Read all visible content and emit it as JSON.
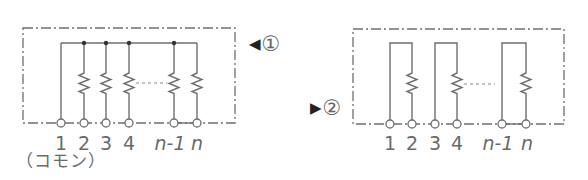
{
  "colors": {
    "line": "#6f6f6f",
    "text": "#6a6a6a",
    "marker": "#222222",
    "background": "#ffffff"
  },
  "left_diagram": {
    "type": "common-bus resistor network",
    "marker": {
      "arrow": "◀",
      "number": "①"
    },
    "terminals": [
      {
        "pin": "1",
        "italic": false
      },
      {
        "pin": "2",
        "italic": false
      },
      {
        "pin": "3",
        "italic": false
      },
      {
        "pin": "4",
        "italic": false
      },
      {
        "pin": "n-1",
        "italic": true
      },
      {
        "pin": "n",
        "italic": true
      }
    ],
    "common_note": "（コモン）"
  },
  "right_diagram": {
    "type": "isolated resistor network",
    "marker": {
      "arrow": "▶",
      "number": "②"
    },
    "terminals": [
      {
        "pin": "1",
        "italic": false
      },
      {
        "pin": "2",
        "italic": false
      },
      {
        "pin": "3",
        "italic": false
      },
      {
        "pin": "4",
        "italic": false
      },
      {
        "pin": "n-1",
        "italic": true
      },
      {
        "pin": "n",
        "italic": true
      }
    ]
  }
}
